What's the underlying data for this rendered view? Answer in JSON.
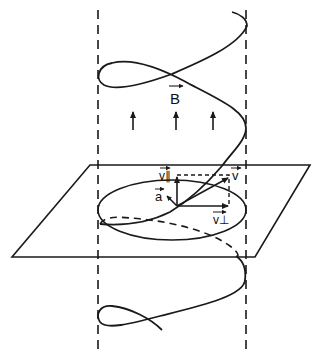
{
  "figure": {
    "colors": {
      "ink": "#1a1a1a",
      "background": "#ffffff"
    },
    "labels": {
      "field": "B",
      "velocity": "v",
      "v_parallel": "v∥",
      "v_perp": "v⊥",
      "acceleration": "a"
    },
    "field_arrows": 3
  }
}
